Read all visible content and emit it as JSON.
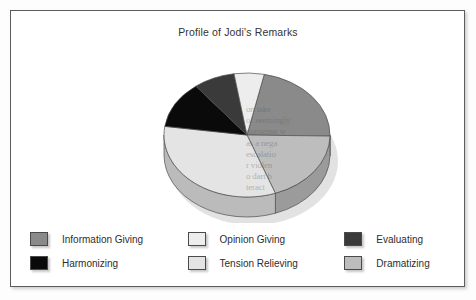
{
  "chart_data": {
    "type": "pie",
    "title": "Profile of Jodi's Remarks",
    "xlabel": "",
    "ylabel": "",
    "legend_position": "bottom",
    "grid": false,
    "three_d": true,
    "categories": [
      "Information Giving",
      "Dramatizing",
      "Tension Relieving",
      "Harmonizing",
      "Evaluating",
      "Opinion Giving"
    ],
    "values": [
      22,
      19,
      33,
      12,
      8,
      6
    ],
    "colors": [
      "#8a8a8a",
      "#bdbdbd",
      "#e4e4e4",
      "#0a0a0a",
      "#3a3a3a",
      "#ededed"
    ],
    "slices": [
      {
        "label": "Information Giving",
        "value": 22,
        "color": "#8a8a8a",
        "start_deg": 12,
        "end_deg": 91
      },
      {
        "label": "Dramatizing",
        "value": 19,
        "color": "#bdbdbd",
        "start_deg": 91,
        "end_deg": 160
      },
      {
        "label": "Tension Relieving",
        "value": 33,
        "color": "#e4e4e4",
        "start_deg": 160,
        "end_deg": 278
      },
      {
        "label": "Harmonizing",
        "value": 12,
        "color": "#0a0a0a",
        "start_deg": 278,
        "end_deg": 322
      },
      {
        "label": "Evaluating",
        "value": 8,
        "color": "#3a3a3a",
        "start_deg": 322,
        "end_deg": 351
      },
      {
        "label": "Opinion Giving",
        "value": 6,
        "color": "#ededed",
        "start_deg": 351,
        "end_deg": 372
      }
    ]
  },
  "legend": {
    "rows": [
      [
        {
          "label": "Information Giving",
          "color": "#8a8a8a"
        },
        {
          "label": "Opinion Giving",
          "color": "#ededed"
        },
        {
          "label": "Evaluating",
          "color": "#3a3a3a"
        }
      ],
      [
        {
          "label": "Harmonizing",
          "color": "#0a0a0a"
        },
        {
          "label": "Tension Relieving",
          "color": "#e4e4e4"
        },
        {
          "label": "Dramatizing",
          "color": "#bdbdbd"
        }
      ]
    ]
  },
  "background_bleed_text": "on take\nof seemingly\nnonsense w\nas a nega\nescalatio\nr violen\no dart b\nteract\nup"
}
